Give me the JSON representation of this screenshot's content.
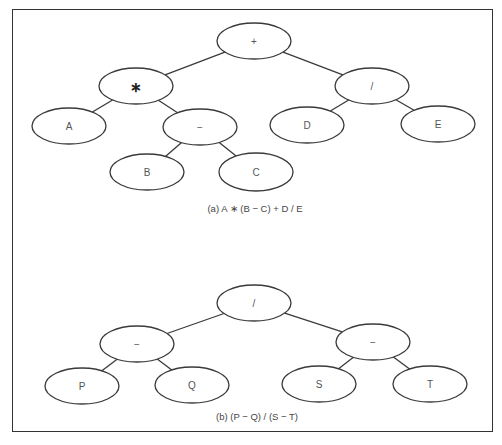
{
  "figure": {
    "frame": {
      "border_color": "#333333"
    },
    "trees": [
      {
        "id": "a",
        "caption": "(a)  A ∗ (B − C) + D / E",
        "caption_pos": {
          "x": 255,
          "y": 208
        },
        "nodes": [
          {
            "id": "plus",
            "label": "+",
            "cx": 254,
            "cy": 41,
            "rx": 37,
            "ry": 18
          },
          {
            "id": "times",
            "label": "∗",
            "cx": 136,
            "cy": 86,
            "rx": 37,
            "ry": 18,
            "bold": true
          },
          {
            "id": "div",
            "label": "/",
            "cx": 372,
            "cy": 86,
            "rx": 37,
            "ry": 18
          },
          {
            "id": "A",
            "label": "A",
            "cx": 69,
            "cy": 126,
            "rx": 37,
            "ry": 18
          },
          {
            "id": "minus",
            "label": "−",
            "cx": 200,
            "cy": 127,
            "rx": 37,
            "ry": 18
          },
          {
            "id": "D",
            "label": "D",
            "cx": 307,
            "cy": 125,
            "rx": 37,
            "ry": 18
          },
          {
            "id": "E",
            "label": "E",
            "cx": 438,
            "cy": 124,
            "rx": 37,
            "ry": 18
          },
          {
            "id": "B",
            "label": "B",
            "cx": 147,
            "cy": 172,
            "rx": 37,
            "ry": 18
          },
          {
            "id": "C",
            "label": "C",
            "cx": 256,
            "cy": 172,
            "rx": 37,
            "ry": 19
          }
        ],
        "edges": [
          [
            "plus",
            "times"
          ],
          [
            "plus",
            "div"
          ],
          [
            "times",
            "A"
          ],
          [
            "times",
            "minus"
          ],
          [
            "minus",
            "B"
          ],
          [
            "minus",
            "C"
          ],
          [
            "div",
            "D"
          ],
          [
            "div",
            "E"
          ]
        ]
      },
      {
        "id": "b",
        "caption": "(b)  (P − Q) / (S − T)",
        "caption_pos": {
          "x": 257,
          "y": 416
        },
        "nodes": [
          {
            "id": "div",
            "label": "/",
            "cx": 254,
            "cy": 303,
            "rx": 37,
            "ry": 18
          },
          {
            "id": "minusL",
            "label": "−",
            "cx": 137,
            "cy": 344,
            "rx": 37,
            "ry": 18
          },
          {
            "id": "minusR",
            "label": "−",
            "cx": 373,
            "cy": 342,
            "rx": 37,
            "ry": 18
          },
          {
            "id": "P",
            "label": "P",
            "cx": 82,
            "cy": 386,
            "rx": 37,
            "ry": 18
          },
          {
            "id": "Q",
            "label": "Q",
            "cx": 192,
            "cy": 385,
            "rx": 37,
            "ry": 18
          },
          {
            "id": "S",
            "label": "S",
            "cx": 319,
            "cy": 384,
            "rx": 37,
            "ry": 18
          },
          {
            "id": "T",
            "label": "T",
            "cx": 430,
            "cy": 384,
            "rx": 37,
            "ry": 18
          }
        ],
        "edges": [
          [
            "div",
            "minusL"
          ],
          [
            "div",
            "minusR"
          ],
          [
            "minusL",
            "P"
          ],
          [
            "minusL",
            "Q"
          ],
          [
            "minusR",
            "S"
          ],
          [
            "minusR",
            "T"
          ]
        ]
      }
    ]
  }
}
